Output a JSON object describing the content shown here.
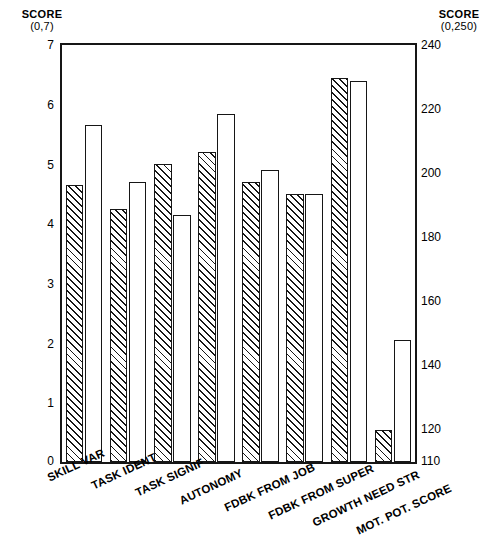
{
  "left_axis": {
    "title_main": "SCORE",
    "title_range": "(0,7)",
    "ticks": [
      "7",
      "6",
      "5",
      "4",
      "3",
      "2",
      "1",
      "0"
    ]
  },
  "right_axis": {
    "title_main": "SCORE",
    "title_range": "(0,250)",
    "ticks": [
      "240",
      "220",
      "200",
      "180",
      "160",
      "140",
      "120",
      "110"
    ]
  },
  "categories": [
    "SKILL VAR",
    "TASK IDENT",
    "TASK SIGNIF",
    "AUTONOMY",
    "FDBK FROM JOB",
    "FDBK FROM SUPER",
    "GROWTH NEED STR",
    "MOT. POT. SCORE"
  ],
  "chart_data": {
    "type": "bar",
    "title": "",
    "xlabel": "",
    "ylabel": "SCORE (0,7)",
    "y2label": "SCORE (0,250)",
    "grid": false,
    "legend": "none",
    "categories": [
      "SKILL VAR",
      "TASK IDENT",
      "TASK SIGNIF",
      "AUTONOMY",
      "FDBK FROM JOB",
      "FDBK FROM SUPER",
      "GROWTH NEED STR",
      "MOT. POT. SCORE"
    ],
    "ylim": [
      0,
      7
    ],
    "y2lim": [
      110,
      240
    ],
    "yticks": [
      0,
      1,
      2,
      3,
      4,
      5,
      6,
      7
    ],
    "y2ticks": [
      110,
      120,
      140,
      160,
      180,
      200,
      220,
      240
    ],
    "note": "First seven category pairs are read on the left (0,7) axis. The final pair, MOT. POT. SCORE, is read on the right (0,250) axis.",
    "series": [
      {
        "name": "hatched",
        "fill": "diagonal-hatch",
        "values": [
          4.65,
          4.25,
          5.0,
          5.2,
          4.7,
          4.5,
          6.45,
          null
        ],
        "values_right_axis": [
          null,
          null,
          null,
          null,
          null,
          null,
          null,
          120
        ]
      },
      {
        "name": "white",
        "fill": "open",
        "values": [
          5.65,
          4.7,
          4.15,
          5.85,
          4.9,
          4.5,
          6.4,
          null
        ],
        "values_right_axis": [
          null,
          null,
          null,
          null,
          null,
          null,
          null,
          148
        ]
      }
    ]
  },
  "colors": {
    "ink": "#161616",
    "paper": "#ffffff"
  }
}
